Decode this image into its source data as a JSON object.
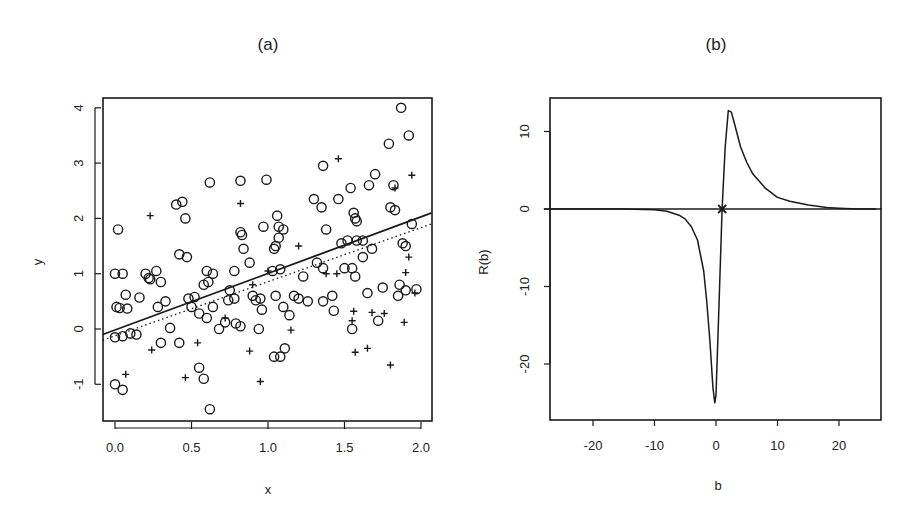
{
  "chart_data": [
    {
      "panel": "(a)",
      "type": "scatter",
      "title": "(a)",
      "xlabel": "x",
      "ylabel": "y",
      "xlim": [
        -0.08,
        2.07
      ],
      "ylim": [
        -1.6,
        4.2
      ],
      "xticks": [
        "0.0",
        "0.5",
        "1.0",
        "1.5",
        "2.0"
      ],
      "yticks": [
        "-1",
        "0",
        "1",
        "2",
        "3",
        "4"
      ],
      "grid": false,
      "legend": null,
      "series": [
        {
          "name": "circles",
          "marker": "o",
          "points": [
            [
              0.02,
              1.8
            ],
            [
              0.0,
              1.0
            ],
            [
              0.05,
              1.0
            ],
            [
              0.03,
              0.38
            ],
            [
              0.01,
              0.4
            ],
            [
              0.08,
              0.37
            ],
            [
              0.07,
              0.62
            ],
            [
              0.0,
              -0.15
            ],
            [
              0.05,
              -0.13
            ],
            [
              0.1,
              -0.08
            ],
            [
              0.14,
              -0.1
            ],
            [
              0.0,
              -1.0
            ],
            [
              0.05,
              -1.1
            ],
            [
              0.16,
              0.57
            ],
            [
              0.2,
              1.0
            ],
            [
              0.22,
              0.92
            ],
            [
              0.23,
              0.9
            ],
            [
              0.27,
              1.05
            ],
            [
              0.3,
              0.85
            ],
            [
              0.28,
              0.4
            ],
            [
              0.33,
              0.5
            ],
            [
              0.36,
              0.02
            ],
            [
              0.4,
              2.25
            ],
            [
              0.44,
              2.3
            ],
            [
              0.46,
              2.0
            ],
            [
              0.42,
              1.35
            ],
            [
              0.47,
              1.3
            ],
            [
              0.48,
              0.55
            ],
            [
              0.52,
              0.58
            ],
            [
              0.5,
              0.4
            ],
            [
              0.55,
              0.28
            ],
            [
              0.6,
              0.2
            ],
            [
              0.3,
              -0.25
            ],
            [
              0.42,
              -0.25
            ],
            [
              0.55,
              -0.7
            ],
            [
              0.58,
              -0.9
            ],
            [
              0.62,
              -1.45
            ],
            [
              0.62,
              2.65
            ],
            [
              0.6,
              1.05
            ],
            [
              0.64,
              1.0
            ],
            [
              0.61,
              0.85
            ],
            [
              0.58,
              0.8
            ],
            [
              0.64,
              0.4
            ],
            [
              0.68,
              0.0
            ],
            [
              0.72,
              0.12
            ],
            [
              0.74,
              0.52
            ],
            [
              0.75,
              0.7
            ],
            [
              0.78,
              0.55
            ],
            [
              0.79,
              0.1
            ],
            [
              0.82,
              0.05
            ],
            [
              0.78,
              1.05
            ],
            [
              0.82,
              2.68
            ],
            [
              0.83,
              1.7
            ],
            [
              0.82,
              1.75
            ],
            [
              0.84,
              1.45
            ],
            [
              0.88,
              1.2
            ],
            [
              0.9,
              0.6
            ],
            [
              0.92,
              0.52
            ],
            [
              0.95,
              0.55
            ],
            [
              0.96,
              0.35
            ],
            [
              0.94,
              0.0
            ],
            [
              0.99,
              2.7
            ],
            [
              0.97,
              1.85
            ],
            [
              1.06,
              2.05
            ],
            [
              1.07,
              1.85
            ],
            [
              1.07,
              1.65
            ],
            [
              1.05,
              1.5
            ],
            [
              1.1,
              1.8
            ],
            [
              1.04,
              1.45
            ],
            [
              1.03,
              1.05
            ],
            [
              1.08,
              1.08
            ],
            [
              1.05,
              0.6
            ],
            [
              1.1,
              0.4
            ],
            [
              1.04,
              -0.5
            ],
            [
              1.08,
              -0.5
            ],
            [
              1.11,
              -0.35
            ],
            [
              1.14,
              0.25
            ],
            [
              1.17,
              0.6
            ],
            [
              1.2,
              0.55
            ],
            [
              1.23,
              0.95
            ],
            [
              1.26,
              0.5
            ],
            [
              1.3,
              2.35
            ],
            [
              1.35,
              2.2
            ],
            [
              1.36,
              2.95
            ],
            [
              1.38,
              1.8
            ],
            [
              1.32,
              1.2
            ],
            [
              1.36,
              1.1
            ],
            [
              1.36,
              0.5
            ],
            [
              1.42,
              0.6
            ],
            [
              1.43,
              0.33
            ],
            [
              1.46,
              2.35
            ],
            [
              1.48,
              1.55
            ],
            [
              1.52,
              1.6
            ],
            [
              1.54,
              2.55
            ],
            [
              1.56,
              2.1
            ],
            [
              1.57,
              2.0
            ],
            [
              1.58,
              1.95
            ],
            [
              1.58,
              1.6
            ],
            [
              1.55,
              1.1
            ],
            [
              1.57,
              0.95
            ],
            [
              1.62,
              1.6
            ],
            [
              1.66,
              2.6
            ],
            [
              1.7,
              2.8
            ],
            [
              1.62,
              1.3
            ],
            [
              1.65,
              0.65
            ],
            [
              1.72,
              0.15
            ],
            [
              1.75,
              0.75
            ],
            [
              1.79,
              3.35
            ],
            [
              1.82,
              2.6
            ],
            [
              1.8,
              2.2
            ],
            [
              1.83,
              2.15
            ],
            [
              1.86,
              0.8
            ],
            [
              1.85,
              0.6
            ],
            [
              1.87,
              4.0
            ],
            [
              1.92,
              3.5
            ],
            [
              1.94,
              1.9
            ],
            [
              1.88,
              1.55
            ],
            [
              1.9,
              1.5
            ],
            [
              1.9,
              0.7
            ],
            [
              1.97,
              0.72
            ],
            [
              1.55,
              0.0
            ],
            [
              1.5,
              1.1
            ],
            [
              1.68,
              1.45
            ]
          ]
        },
        {
          "name": "plus",
          "marker": "+",
          "points": [
            [
              0.07,
              -0.82
            ],
            [
              0.23,
              2.05
            ],
            [
              0.24,
              -0.38
            ],
            [
              0.46,
              -0.88
            ],
            [
              0.54,
              -0.25
            ],
            [
              0.82,
              2.27
            ],
            [
              0.88,
              -0.4
            ],
            [
              0.95,
              -0.95
            ],
            [
              1.15,
              -0.02
            ],
            [
              1.2,
              1.5
            ],
            [
              1.46,
              3.08
            ],
            [
              1.45,
              1.0
            ],
            [
              1.38,
              1.0
            ],
            [
              1.56,
              0.32
            ],
            [
              1.55,
              0.15
            ],
            [
              1.57,
              -0.42
            ],
            [
              1.65,
              -0.35
            ],
            [
              1.68,
              0.3
            ],
            [
              1.76,
              0.28
            ],
            [
              1.8,
              -0.65
            ],
            [
              1.83,
              2.55
            ],
            [
              1.89,
              0.12
            ],
            [
              1.9,
              1.02
            ],
            [
              1.92,
              1.3
            ],
            [
              1.94,
              2.78
            ],
            [
              1.96,
              0.65
            ],
            [
              0.9,
              0.8
            ],
            [
              0.72,
              0.2
            ],
            [
              1.0,
              1.05
            ]
          ]
        },
        {
          "name": "fit (solid)",
          "type": "line",
          "style": "solid",
          "points": [
            [
              -0.08,
              -0.1
            ],
            [
              2.07,
              2.1
            ]
          ]
        },
        {
          "name": "fit (dotted)",
          "type": "line",
          "style": "dotted",
          "points": [
            [
              -0.08,
              -0.2
            ],
            [
              2.07,
              1.9
            ]
          ]
        }
      ]
    },
    {
      "panel": "(b)",
      "type": "line",
      "title": "(b)",
      "xlabel": "b",
      "ylabel": "R(b)",
      "xlim": [
        -27,
        27
      ],
      "ylim": [
        -27.5,
        14.5
      ],
      "xticks": [
        "-20",
        "-10",
        "0",
        "10",
        "20"
      ],
      "yticks": [
        "-20",
        "-10",
        "0",
        "10"
      ],
      "grid": false,
      "legend": null,
      "annotations": [
        {
          "marker": "x",
          "at": [
            1,
            0
          ]
        }
      ],
      "series": [
        {
          "name": "zero line",
          "style": "solid",
          "points": [
            [
              -28,
              0
            ],
            [
              27,
              0
            ]
          ]
        },
        {
          "name": "R(b)",
          "style": "solid",
          "x": [
            -27,
            -20,
            -15,
            -10,
            -8,
            -6,
            -5,
            -4,
            -3,
            -2,
            -1.5,
            -1,
            -0.5,
            -0.2,
            0,
            0.5,
            1,
            1.5,
            2,
            2.5,
            3,
            4,
            5,
            6,
            8,
            10,
            12,
            15,
            18,
            20,
            23,
            26
          ],
          "y": [
            0,
            0,
            0,
            -0.1,
            -0.3,
            -0.8,
            -1.3,
            -2.3,
            -4,
            -8,
            -12,
            -17,
            -23,
            -25,
            -24,
            -12,
            0,
            8,
            12.7,
            12.5,
            11,
            8,
            6,
            4.5,
            2.7,
            1.5,
            1.0,
            0.5,
            0.2,
            0.1,
            0.0,
            0.0
          ]
        }
      ]
    }
  ],
  "panels": {
    "a": {
      "title": "(a)",
      "xlabel": "x",
      "ylabel": "y",
      "xticks": [
        "0.0",
        "0.5",
        "1.0",
        "1.5",
        "2.0"
      ],
      "yticks": [
        "-1",
        "0",
        "1",
        "2",
        "3",
        "4"
      ]
    },
    "b": {
      "title": "(b)",
      "xlabel": "b",
      "ylabel": "R(b)",
      "xticks": [
        "-20",
        "-10",
        "0",
        "10",
        "20"
      ],
      "yticks": [
        "-20",
        "-10",
        "0",
        "10"
      ]
    }
  },
  "colors": {
    "ink": "#1a1a1a",
    "background": "#ffffff"
  }
}
